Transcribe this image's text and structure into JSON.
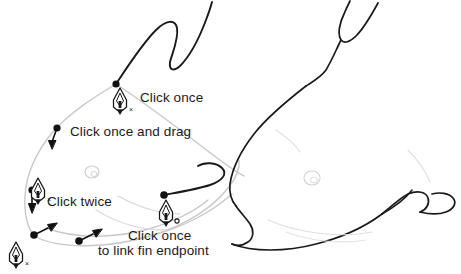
{
  "scene": {
    "title": "Pen tool dolphin tracing tutorial",
    "background_color": "#ffffff",
    "stroke_color": "#1a1a1a",
    "template_color": "#c9c9c9",
    "text_color": "#1a1a1a"
  },
  "callouts": [
    {
      "id": "click-once",
      "text": "Click once",
      "x": 140,
      "y": 90
    },
    {
      "id": "click-once-and-drag",
      "text": "Click once and drag",
      "x": 70,
      "y": 124
    },
    {
      "id": "click-twice",
      "text": "Click twice",
      "x": 47,
      "y": 194
    },
    {
      "id": "click-once-link-fin-endpoint-line1",
      "text": "Click once",
      "x": 128,
      "y": 228
    },
    {
      "id": "click-once-link-fin-endpoint-line2",
      "text": "to link fin endpoint",
      "x": 98,
      "y": 243
    }
  ],
  "pen_cursors": [
    {
      "id": "pen-cursor-dorsal",
      "x": 112,
      "y": 88,
      "badge": "x"
    },
    {
      "id": "pen-cursor-belly",
      "x": 30,
      "y": 178,
      "badge": "x"
    },
    {
      "id": "pen-cursor-fin",
      "x": 158,
      "y": 200,
      "badge": "o"
    },
    {
      "id": "pen-cursor-tail",
      "x": 8,
      "y": 242,
      "badge": "x"
    }
  ],
  "anchor_points": [
    {
      "id": "anchor-dorsal-start",
      "x": 116,
      "y": 83
    },
    {
      "id": "anchor-snout-drag",
      "x": 57,
      "y": 128
    },
    {
      "id": "anchor-belly-double",
      "x": 32,
      "y": 190
    },
    {
      "id": "anchor-tail-junction",
      "x": 34,
      "y": 235
    },
    {
      "id": "anchor-fin-end",
      "x": 164,
      "y": 195
    },
    {
      "id": "anchor-link-target",
      "x": 79,
      "y": 241
    }
  ],
  "direction_handles": [
    {
      "id": "handle-snout",
      "from_x": 57,
      "from_y": 128,
      "to_x": 51,
      "to_y": 146
    },
    {
      "id": "handle-belly",
      "from_x": 32,
      "from_y": 190,
      "to_x": 32,
      "to_y": 212
    },
    {
      "id": "handle-tail-junction",
      "from_x": 34,
      "from_y": 235,
      "to_x": 57,
      "to_y": 224
    },
    {
      "id": "handle-link-target",
      "from_x": 79,
      "from_y": 241,
      "to_x": 100,
      "to_y": 231
    }
  ],
  "shapes": [
    {
      "id": "drawn-dorsal-fin-path",
      "kind": "active-stroke"
    },
    {
      "id": "drawn-pectoral-fin-path",
      "kind": "active-stroke"
    },
    {
      "id": "template-dolphin-outline",
      "kind": "template"
    },
    {
      "id": "finished-dolphin-outline",
      "kind": "finished"
    }
  ]
}
